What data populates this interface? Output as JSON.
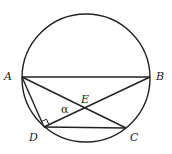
{
  "diagram": {
    "circle": {
      "cx": 86,
      "cy": 78,
      "r": 64
    },
    "points": {
      "A": {
        "label": "A",
        "x": 22,
        "y": 77
      },
      "B": {
        "label": "B",
        "x": 150,
        "y": 77
      },
      "C": {
        "label": "C",
        "x": 126,
        "y": 128
      },
      "D": {
        "label": "D",
        "x": 44,
        "y": 127
      },
      "E": {
        "label": "E",
        "x": 86,
        "y": 108
      }
    },
    "segments": [
      "AB",
      "AC",
      "BD",
      "AD",
      "DC"
    ],
    "angle_label": "α",
    "right_angle_at": "D",
    "stroke_color": "#222222"
  }
}
